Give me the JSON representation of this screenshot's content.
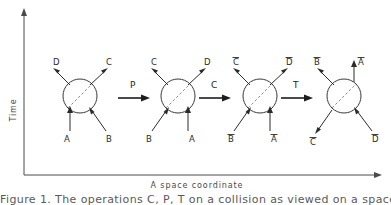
{
  "figure": {
    "axes": {
      "y_label": "Time",
      "x_label": "A space coordinate"
    },
    "caption": "Figure 1. The operations C, P, T on a collision as viewed on a space-time",
    "operators": [
      {
        "label": "P",
        "name": "parity"
      },
      {
        "label": "C",
        "name": "charge-conjugation"
      },
      {
        "label": "T",
        "name": "time-reversal"
      }
    ],
    "vertices": [
      {
        "id": "vertex-1",
        "labels": {
          "upper_left": "D",
          "upper_right": "C",
          "lower_left": "A",
          "lower_right": "B"
        }
      },
      {
        "id": "vertex-2",
        "labels": {
          "upper_left": "C",
          "upper_right": "D",
          "lower_left": "B",
          "lower_right": "A"
        }
      },
      {
        "id": "vertex-3",
        "labels": {
          "upper_left": "C",
          "upper_right": "D",
          "lower_left": "B",
          "lower_right": "A"
        }
      },
      {
        "id": "vertex-4",
        "labels": {
          "upper_left": "B",
          "upper_right": "A",
          "lower_left": "C",
          "lower_right": "D"
        }
      }
    ],
    "colors": {
      "axis": "#4a4a4a",
      "circle": "#3a3a3a",
      "dashed": "#8d8d8d",
      "vector": "#2b2b2b",
      "operator": "#1d1d1d",
      "background": "#ffffff"
    }
  }
}
